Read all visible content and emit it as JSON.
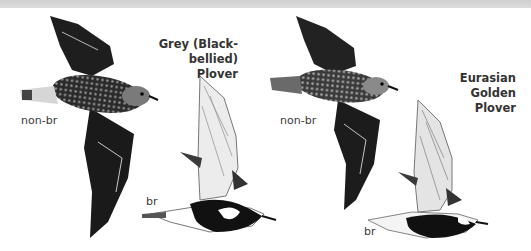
{
  "plate": {
    "species": [
      {
        "name": "Grey (Black-bellied) Plover",
        "title_line1": "Grey (Black-bellied)",
        "title_line2": "Plover",
        "plumages": [
          {
            "label": "non-br"
          },
          {
            "label": "br"
          }
        ]
      },
      {
        "name": "Eurasian Golden Plover",
        "title_line1": "Eurasian Golden",
        "title_line2": "Plover",
        "plumages": [
          {
            "label": "non-br"
          },
          {
            "label": "br"
          }
        ]
      }
    ],
    "colors": {
      "ink": "#1a1a1a",
      "mid_grey": "#6b6b6b",
      "light_grey": "#d8d8d8",
      "header_band": "#d4d4d4"
    }
  }
}
